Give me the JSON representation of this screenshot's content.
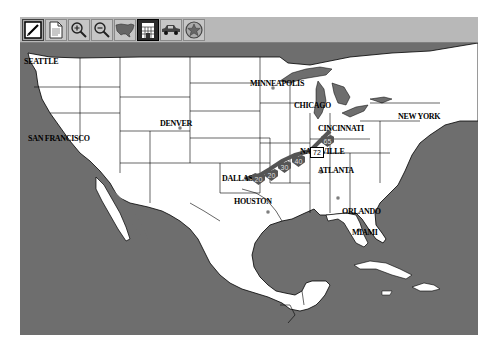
{
  "toolbar": {
    "buttons": [
      {
        "name": "edit-button",
        "icon": "pencil-icon",
        "state": "pressed"
      },
      {
        "name": "document-button",
        "icon": "document-icon",
        "state": "normal"
      },
      {
        "name": "zoom-in-button",
        "icon": "zoom-in-icon",
        "state": "normal"
      },
      {
        "name": "zoom-out-button",
        "icon": "zoom-out-icon",
        "state": "normal"
      },
      {
        "name": "usa-map-button",
        "icon": "usa-map-icon",
        "state": "normal"
      },
      {
        "name": "building-button",
        "icon": "building-icon",
        "state": "active"
      },
      {
        "name": "car-button",
        "icon": "car-icon",
        "state": "normal"
      },
      {
        "name": "badge-button",
        "icon": "star-badge-icon",
        "state": "normal"
      }
    ]
  },
  "map": {
    "colors": {
      "land": "#ffffff",
      "water": "#6e6e6e",
      "border": "#000000",
      "route": "#555555"
    },
    "cities": [
      {
        "name": "SEATTLE"
      },
      {
        "name": "SAN FRANCISCO"
      },
      {
        "name": "DENVER"
      },
      {
        "name": "MINNEAPOLIS"
      },
      {
        "name": "CHICAGO"
      },
      {
        "name": "CINCINNATI"
      },
      {
        "name": "NEW YORK"
      },
      {
        "name": "NASHVILLE"
      },
      {
        "name": "ATLANTA"
      },
      {
        "name": "DALLAS"
      },
      {
        "name": "HOUSTON"
      },
      {
        "name": "ORLANDO"
      },
      {
        "name": "MIAMI"
      }
    ],
    "route_shields": [
      "20",
      "20",
      "30",
      "40",
      "65"
    ],
    "route_box": "72"
  }
}
